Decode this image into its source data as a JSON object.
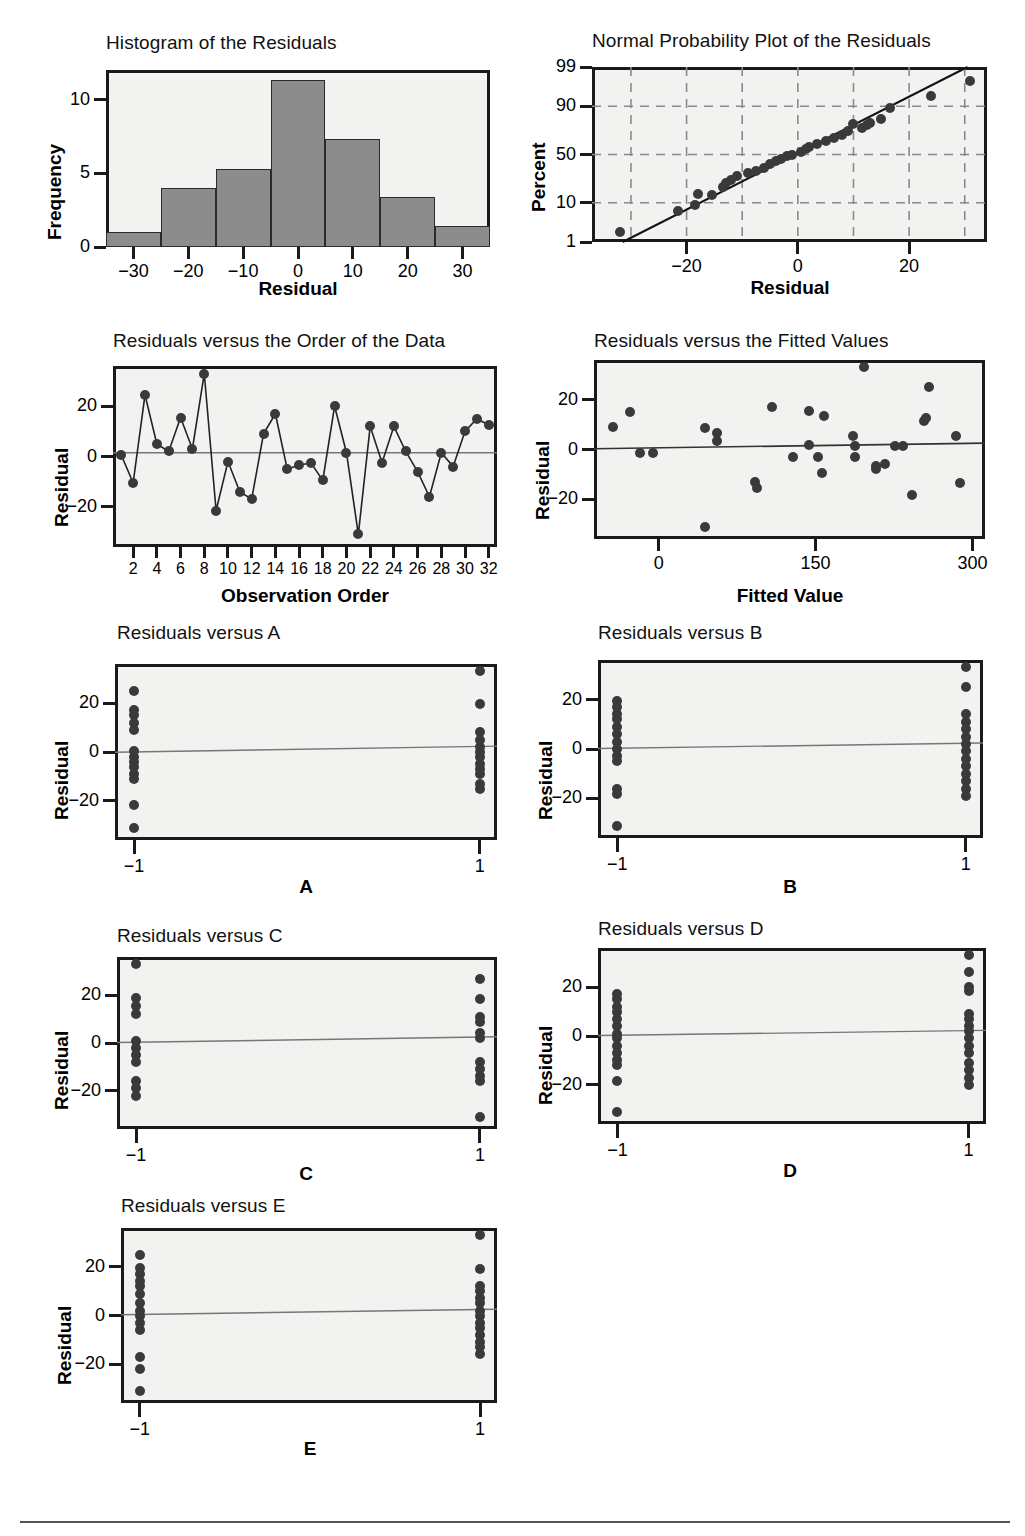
{
  "page": {
    "footer_rule": true
  },
  "chart_data": [
    {
      "id": "histogram",
      "type": "bar",
      "title": "Histogram of the Residuals",
      "xlabel": "Residual",
      "ylabel": "Frequency",
      "xlim": [
        -35,
        35
      ],
      "ylim": [
        0,
        12
      ],
      "xticks": [
        "-30",
        "-20",
        "-10",
        "0",
        "10",
        "20",
        "30"
      ],
      "xtick_values": [
        -30,
        -20,
        -10,
        0,
        10,
        20,
        30
      ],
      "yticks": [
        "0",
        "5",
        "10"
      ],
      "ytick_values": [
        0,
        5,
        10
      ],
      "bin_edges": [
        -35,
        -25,
        -15,
        -5,
        5,
        15,
        25,
        35
      ],
      "categories": [
        "-35 to -25",
        "-25 to -15",
        "-15 to -5",
        "-5 to 5",
        "5 to 15",
        "15 to 25",
        "25 to 35"
      ],
      "values": [
        1,
        4,
        5.3,
        11.3,
        7.3,
        3.4,
        1.4
      ],
      "grid": false
    },
    {
      "id": "normal-probability-plot",
      "type": "scatter",
      "title": "Normal Probability Plot of the Residuals",
      "xlabel": "Residual",
      "ylabel": "Percent",
      "xlim": [
        -37,
        34
      ],
      "xticks": [
        "-20",
        "0",
        "20"
      ],
      "xtick_values": [
        -20,
        0,
        20
      ],
      "yticks": [
        "1",
        "10",
        "50",
        "90",
        "99"
      ],
      "ytick_values": [
        1,
        10,
        50,
        90,
        99
      ],
      "grid": true,
      "grid_style": "dashed",
      "fit_line": {
        "from": [
          -31.5,
          1
        ],
        "to": [
          30.5,
          99
        ]
      },
      "points": [
        {
          "x": -32.0,
          "y": 2.0
        },
        {
          "x": -21.5,
          "y": 6.5
        },
        {
          "x": -18.5,
          "y": 9.0
        },
        {
          "x": -18.0,
          "y": 14.5
        },
        {
          "x": -15.5,
          "y": 14.0
        },
        {
          "x": -13.5,
          "y": 19.5
        },
        {
          "x": -13.0,
          "y": 22.5
        },
        {
          "x": -12.0,
          "y": 25.0
        },
        {
          "x": -11.0,
          "y": 28.0
        },
        {
          "x": -9.0,
          "y": 31.0
        },
        {
          "x": -7.5,
          "y": 33.0
        },
        {
          "x": -6.0,
          "y": 36.0
        },
        {
          "x": -5.0,
          "y": 40.0
        },
        {
          "x": -4.0,
          "y": 43.0
        },
        {
          "x": -3.0,
          "y": 45.0
        },
        {
          "x": -2.0,
          "y": 48.0
        },
        {
          "x": -1.0,
          "y": 50.0
        },
        {
          "x": 0.5,
          "y": 53.0
        },
        {
          "x": 1.5,
          "y": 56.0
        },
        {
          "x": 2.0,
          "y": 58.0
        },
        {
          "x": 3.5,
          "y": 61.0
        },
        {
          "x": 5.0,
          "y": 64.0
        },
        {
          "x": 6.5,
          "y": 67.0
        },
        {
          "x": 8.0,
          "y": 70.0
        },
        {
          "x": 9.0,
          "y": 73.0
        },
        {
          "x": 10.0,
          "y": 79.0
        },
        {
          "x": 11.5,
          "y": 76.0
        },
        {
          "x": 12.5,
          "y": 78.0
        },
        {
          "x": 13.0,
          "y": 80.0
        },
        {
          "x": 15.0,
          "y": 83.0
        },
        {
          "x": 16.5,
          "y": 89.0
        },
        {
          "x": 24.0,
          "y": 94.0
        },
        {
          "x": 31.0,
          "y": 97.5
        }
      ]
    },
    {
      "id": "residuals-vs-order",
      "type": "line",
      "title": "Residuals versus the Order of the Data",
      "xlabel": "Observation Order",
      "ylabel": "Residual",
      "xlim": [
        0.3,
        32.7
      ],
      "ylim": [
        -36,
        36
      ],
      "xticks": [
        "2",
        "4",
        "6",
        "8",
        "10",
        "12",
        "14",
        "16",
        "18",
        "20",
        "22",
        "24",
        "26",
        "28",
        "30",
        "32"
      ],
      "xtick_values": [
        2,
        4,
        6,
        8,
        10,
        12,
        14,
        16,
        18,
        20,
        22,
        24,
        26,
        28,
        30,
        32
      ],
      "yticks": [
        "-20",
        "0",
        "20"
      ],
      "ytick_values": [
        -20,
        0,
        20
      ],
      "reference_line": 1.5,
      "x": [
        1,
        2,
        3,
        4,
        5,
        6,
        7,
        8,
        9,
        10,
        11,
        12,
        13,
        14,
        15,
        16,
        17,
        18,
        19,
        20,
        21,
        22,
        23,
        24,
        25,
        26,
        27,
        28,
        29,
        30,
        31,
        32
      ],
      "values": [
        0.5,
        -10.5,
        24.5,
        5,
        2,
        15.5,
        3,
        33,
        -21.5,
        -2,
        -14,
        -17,
        9,
        17,
        -5,
        -3.5,
        -2.5,
        -9.5,
        20,
        1.5,
        -31,
        12,
        -2.5,
        12,
        2,
        -6,
        -16,
        1.5,
        -4,
        10,
        15,
        12.5
      ]
    },
    {
      "id": "residuals-vs-fitted",
      "type": "scatter",
      "title": "Residuals versus the Fitted Values",
      "xlabel": "Fitted Value",
      "ylabel": "Residual",
      "xlim": [
        -62,
        312
      ],
      "ylim": [
        -36,
        36
      ],
      "xticks": [
        "0",
        "150",
        "300"
      ],
      "xtick_values": [
        0,
        150,
        300
      ],
      "yticks": [
        "-20",
        "0",
        "20"
      ],
      "ytick_values": [
        -20,
        0,
        20
      ],
      "reference_line": {
        "from": [
          -62,
          0.3
        ],
        "to": [
          312,
          2.6
        ]
      },
      "points": [
        {
          "x": -44,
          "y": 9
        },
        {
          "x": -28,
          "y": 15
        },
        {
          "x": -18,
          "y": -1.5
        },
        {
          "x": -6,
          "y": -1.5
        },
        {
          "x": 44,
          "y": 8.5
        },
        {
          "x": 44,
          "y": -31
        },
        {
          "x": 56,
          "y": 6.5
        },
        {
          "x": 56,
          "y": 3.5
        },
        {
          "x": 92,
          "y": -13
        },
        {
          "x": 94,
          "y": -15.5
        },
        {
          "x": 108,
          "y": 17
        },
        {
          "x": 128,
          "y": -3
        },
        {
          "x": 144,
          "y": 15.5
        },
        {
          "x": 144,
          "y": 2
        },
        {
          "x": 152,
          "y": -3
        },
        {
          "x": 158,
          "y": 13.5
        },
        {
          "x": 156,
          "y": -9.5
        },
        {
          "x": 186,
          "y": 5.5
        },
        {
          "x": 188,
          "y": 1.5
        },
        {
          "x": 188,
          "y": -3
        },
        {
          "x": 196,
          "y": 33
        },
        {
          "x": 208,
          "y": -6.5
        },
        {
          "x": 208,
          "y": -8
        },
        {
          "x": 216,
          "y": -6
        },
        {
          "x": 226,
          "y": 1.5
        },
        {
          "x": 234,
          "y": 1.5
        },
        {
          "x": 242,
          "y": -18.5
        },
        {
          "x": 254,
          "y": 11.5
        },
        {
          "x": 256,
          "y": 12.5
        },
        {
          "x": 258,
          "y": 25
        },
        {
          "x": 284,
          "y": 5.5
        },
        {
          "x": 288,
          "y": -13.5
        }
      ]
    },
    {
      "id": "residuals-vs-a",
      "type": "scatter",
      "title": "Residuals versus A",
      "xlabel": "A",
      "ylabel": "Residual",
      "xticks": [
        "-1",
        "1"
      ],
      "xtick_values": [
        -1,
        1
      ],
      "ylim": [
        -36,
        36
      ],
      "yticks": [
        "-20",
        "0",
        "20"
      ],
      "ytick_values": [
        -20,
        0,
        20
      ],
      "reference_line": {
        "from": -0.1,
        "to": 2.4
      },
      "points": [
        {
          "x": -1,
          "y": 25
        },
        {
          "x": -1,
          "y": 17
        },
        {
          "x": -1,
          "y": 15
        },
        {
          "x": -1,
          "y": 12
        },
        {
          "x": -1,
          "y": 9
        },
        {
          "x": -1,
          "y": 0.5
        },
        {
          "x": -1,
          "y": -2
        },
        {
          "x": -1,
          "y": -4
        },
        {
          "x": -1,
          "y": -6
        },
        {
          "x": -1,
          "y": -9
        },
        {
          "x": -1,
          "y": -11
        },
        {
          "x": -1,
          "y": -21.5
        },
        {
          "x": -1,
          "y": -31
        },
        {
          "x": 1,
          "y": 33
        },
        {
          "x": 1,
          "y": 19.5
        },
        {
          "x": 1,
          "y": 8
        },
        {
          "x": 1,
          "y": 5
        },
        {
          "x": 1,
          "y": 2
        },
        {
          "x": 1,
          "y": 0
        },
        {
          "x": 1,
          "y": -2
        },
        {
          "x": 1,
          "y": -5
        },
        {
          "x": 1,
          "y": -7
        },
        {
          "x": 1,
          "y": -9
        },
        {
          "x": 1,
          "y": -13
        },
        {
          "x": 1,
          "y": -15
        }
      ]
    },
    {
      "id": "residuals-vs-b",
      "type": "scatter",
      "title": "Residuals versus B",
      "xlabel": "B",
      "ylabel": "Residual",
      "xticks": [
        "-1",
        "1"
      ],
      "xtick_values": [
        -1,
        1
      ],
      "ylim": [
        -36,
        36
      ],
      "yticks": [
        "-20",
        "0",
        "20"
      ],
      "ytick_values": [
        -20,
        0,
        20
      ],
      "reference_line": {
        "from": 0.2,
        "to": 2.4
      },
      "points": [
        {
          "x": -1,
          "y": 19.5
        },
        {
          "x": -1,
          "y": 17
        },
        {
          "x": -1,
          "y": 14
        },
        {
          "x": -1,
          "y": 12
        },
        {
          "x": -1,
          "y": 9
        },
        {
          "x": -1,
          "y": 6
        },
        {
          "x": -1,
          "y": 3
        },
        {
          "x": -1,
          "y": 0
        },
        {
          "x": -1,
          "y": -3
        },
        {
          "x": -1,
          "y": -5
        },
        {
          "x": -1,
          "y": -16
        },
        {
          "x": -1,
          "y": -18
        },
        {
          "x": -1,
          "y": -31
        },
        {
          "x": 1,
          "y": 33
        },
        {
          "x": 1,
          "y": 25
        },
        {
          "x": 1,
          "y": 14
        },
        {
          "x": 1,
          "y": 11
        },
        {
          "x": 1,
          "y": 8
        },
        {
          "x": 1,
          "y": 5
        },
        {
          "x": 1,
          "y": 2
        },
        {
          "x": 1,
          "y": -1
        },
        {
          "x": 1,
          "y": -4
        },
        {
          "x": 1,
          "y": -7
        },
        {
          "x": 1,
          "y": -10
        },
        {
          "x": 1,
          "y": -13
        },
        {
          "x": 1,
          "y": -16
        },
        {
          "x": 1,
          "y": -19
        }
      ]
    },
    {
      "id": "residuals-vs-c",
      "type": "scatter",
      "title": "Residuals versus C",
      "xlabel": "C",
      "ylabel": "Residual",
      "xticks": [
        "-1",
        "1"
      ],
      "xtick_values": [
        -1,
        1
      ],
      "ylim": [
        -36,
        36
      ],
      "yticks": [
        "-20",
        "0",
        "20"
      ],
      "ytick_values": [
        -20,
        0,
        20
      ],
      "reference_line": {
        "from": 0.2,
        "to": 2.6
      },
      "points": [
        {
          "x": -1,
          "y": 33
        },
        {
          "x": -1,
          "y": 19
        },
        {
          "x": -1,
          "y": 15.5
        },
        {
          "x": -1,
          "y": 12
        },
        {
          "x": -1,
          "y": 1
        },
        {
          "x": -1,
          "y": -2
        },
        {
          "x": -1,
          "y": -5
        },
        {
          "x": -1,
          "y": -8
        },
        {
          "x": -1,
          "y": -16
        },
        {
          "x": -1,
          "y": -19
        },
        {
          "x": -1,
          "y": -22
        },
        {
          "x": 1,
          "y": 27
        },
        {
          "x": 1,
          "y": 18.5
        },
        {
          "x": 1,
          "y": 11
        },
        {
          "x": 1,
          "y": 9
        },
        {
          "x": 1,
          "y": 4
        },
        {
          "x": 1,
          "y": 2
        },
        {
          "x": 1,
          "y": -8
        },
        {
          "x": 1,
          "y": -11
        },
        {
          "x": 1,
          "y": -14
        },
        {
          "x": 1,
          "y": -16
        },
        {
          "x": 1,
          "y": -31
        }
      ]
    },
    {
      "id": "residuals-vs-d",
      "type": "scatter",
      "title": "Residuals versus D",
      "xlabel": "D",
      "ylabel": "Residual",
      "xticks": [
        "-1",
        "1"
      ],
      "xtick_values": [
        -1,
        1
      ],
      "ylim": [
        -36,
        36
      ],
      "yticks": [
        "-20",
        "0",
        "20"
      ],
      "ytick_values": [
        -20,
        0,
        20
      ],
      "reference_line": {
        "from": 0.2,
        "to": 2.3
      },
      "points": [
        {
          "x": -1,
          "y": 17
        },
        {
          "x": -1,
          "y": 15
        },
        {
          "x": -1,
          "y": 12
        },
        {
          "x": -1,
          "y": 10
        },
        {
          "x": -1,
          "y": 7
        },
        {
          "x": -1,
          "y": 4
        },
        {
          "x": -1,
          "y": 1
        },
        {
          "x": -1,
          "y": -1
        },
        {
          "x": -1,
          "y": -4
        },
        {
          "x": -1,
          "y": -7
        },
        {
          "x": -1,
          "y": -10
        },
        {
          "x": -1,
          "y": -12
        },
        {
          "x": -1,
          "y": -18.5
        },
        {
          "x": -1,
          "y": -31
        },
        {
          "x": 1,
          "y": 33
        },
        {
          "x": 1,
          "y": 26
        },
        {
          "x": 1,
          "y": 20
        },
        {
          "x": 1,
          "y": 18.5
        },
        {
          "x": 1,
          "y": 9
        },
        {
          "x": 1,
          "y": 7
        },
        {
          "x": 1,
          "y": 4
        },
        {
          "x": 1,
          "y": 2
        },
        {
          "x": 1,
          "y": -1
        },
        {
          "x": 1,
          "y": -4
        },
        {
          "x": 1,
          "y": -7
        },
        {
          "x": 1,
          "y": -11
        },
        {
          "x": 1,
          "y": -14
        },
        {
          "x": 1,
          "y": -17
        },
        {
          "x": 1,
          "y": -20
        }
      ]
    },
    {
      "id": "residuals-vs-e",
      "type": "scatter",
      "title": "Residuals versus E",
      "xlabel": "E",
      "ylabel": "Residual",
      "xticks": [
        "-1",
        "1"
      ],
      "xtick_values": [
        -1,
        1
      ],
      "ylim": [
        -36,
        36
      ],
      "yticks": [
        "-20",
        "0",
        "20"
      ],
      "ytick_values": [
        -20,
        0,
        20
      ],
      "reference_line": {
        "from": 0.3,
        "to": 2.6
      },
      "points": [
        {
          "x": -1,
          "y": 25
        },
        {
          "x": -1,
          "y": 19.5
        },
        {
          "x": -1,
          "y": 17
        },
        {
          "x": -1,
          "y": 14
        },
        {
          "x": -1,
          "y": 12
        },
        {
          "x": -1,
          "y": 9
        },
        {
          "x": -1,
          "y": 5
        },
        {
          "x": -1,
          "y": 2
        },
        {
          "x": -1,
          "y": 0
        },
        {
          "x": -1,
          "y": -3
        },
        {
          "x": -1,
          "y": -6
        },
        {
          "x": -1,
          "y": -17
        },
        {
          "x": -1,
          "y": -22
        },
        {
          "x": -1,
          "y": -31
        },
        {
          "x": 1,
          "y": 33
        },
        {
          "x": 1,
          "y": 19
        },
        {
          "x": 1,
          "y": 12
        },
        {
          "x": 1,
          "y": 10
        },
        {
          "x": 1,
          "y": 7
        },
        {
          "x": 1,
          "y": 5
        },
        {
          "x": 1,
          "y": 2
        },
        {
          "x": 1,
          "y": 0
        },
        {
          "x": 1,
          "y": -3
        },
        {
          "x": 1,
          "y": -5
        },
        {
          "x": 1,
          "y": -8
        },
        {
          "x": 1,
          "y": -11
        },
        {
          "x": 1,
          "y": -13
        },
        {
          "x": 1,
          "y": -16
        }
      ]
    }
  ]
}
